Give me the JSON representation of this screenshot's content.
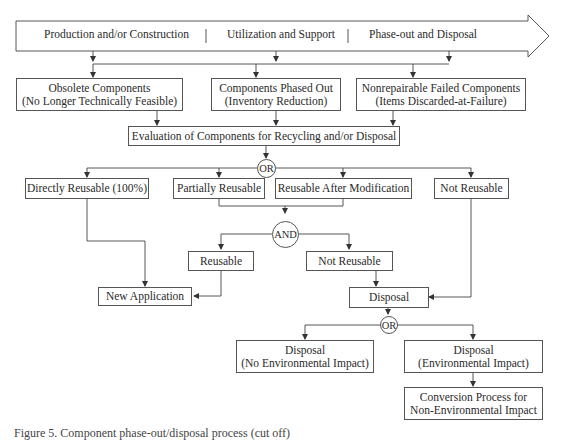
{
  "timeline": {
    "phases": [
      "Production and/or Construction",
      "Utilization and Support",
      "Phase-out and Disposal"
    ]
  },
  "sources": [
    {
      "line1": "Obsolete Components",
      "line2": "(No Longer Technically Feasible)"
    },
    {
      "line1": "Components Phased Out",
      "line2": "(Inventory Reduction)"
    },
    {
      "line1": "Nonrepairable Failed Components",
      "line2": "(Items Discarded-at-Failure)"
    }
  ],
  "evaluation": {
    "label": "Evaluation of Components for Recycling and/or Disposal"
  },
  "gates": {
    "or1": "OR",
    "and1": "AND",
    "or2": "OR"
  },
  "reuse_options": [
    {
      "label": "Directly Reusable (100%)"
    },
    {
      "label": "Partially Reusable"
    },
    {
      "label": "Reusable After Modification"
    },
    {
      "label": "Not Reusable"
    }
  ],
  "and_outcomes": {
    "reusable": "Reusable",
    "not_reusable": "Not Reusable"
  },
  "new_application": {
    "label": "New Application"
  },
  "disposal": {
    "label": "Disposal"
  },
  "disposal_outcomes": [
    {
      "line1": "Disposal",
      "line2": "(No Environmental Impact)"
    },
    {
      "line1": "Disposal",
      "line2": "(Environmental Impact)"
    }
  ],
  "conversion": {
    "line1": "Conversion Process for",
    "line2": "Non-Environmental Impact"
  },
  "caption": {
    "text": "Figure 5. Component phase-out/disposal process (cut off)"
  }
}
